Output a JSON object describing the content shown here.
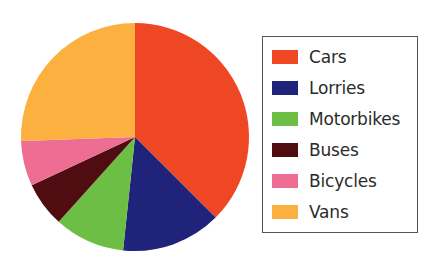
{
  "chart_data": {
    "type": "pie",
    "title": "",
    "categories": [
      "Cars",
      "Lorries",
      "Motorbikes",
      "Buses",
      "Bicycles",
      "Vans"
    ],
    "values": [
      37.5,
      14.2,
      10.0,
      6.4,
      6.4,
      25.5
    ],
    "unit": "percent",
    "start_angle_deg": 0,
    "direction": "clockwise",
    "colors": [
      "#EF4723",
      "#1F2379",
      "#6DBE45",
      "#4F0D11",
      "#EE6D93",
      "#FBB03F"
    ],
    "slice_end_angles_deg": [
      135,
      186,
      222,
      245,
      268,
      360
    ],
    "legend": {
      "position": "right",
      "border_color": "#555555",
      "entries": [
        {
          "label": "Cars",
          "color": "#EF4723"
        },
        {
          "label": "Lorries",
          "color": "#1F2379"
        },
        {
          "label": "Motorbikes",
          "color": "#6DBE45"
        },
        {
          "label": "Buses",
          "color": "#4F0D11"
        },
        {
          "label": "Bicycles",
          "color": "#EE6D93"
        },
        {
          "label": "Vans",
          "color": "#FBB03F"
        }
      ]
    },
    "geometry": {
      "center_x": 135,
      "center_y": 137,
      "radius": 114
    }
  }
}
